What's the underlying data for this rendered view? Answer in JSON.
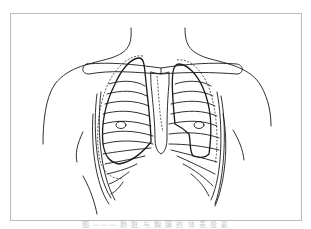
{
  "figure": {
    "caption": "图 ——— 肺 脏 与 胸 膜 的 体 表 投 影",
    "line_color": "#1a1a1a",
    "dashed_line_color": "#333333",
    "border_color": "#b9b9b9"
  }
}
